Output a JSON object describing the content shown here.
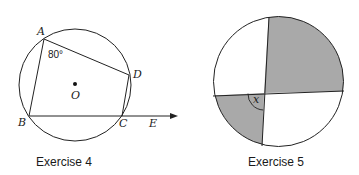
{
  "exercise4": {
    "caption": "Exercise 4",
    "labels": {
      "A": "A",
      "B": "B",
      "C": "C",
      "D": "D",
      "E": "E",
      "O": "O"
    },
    "angle_label": "80°",
    "circle": {
      "cx": 75,
      "cy": 85,
      "r": 56
    },
    "points": {
      "A": [
        44,
        39
      ],
      "B": [
        29,
        116
      ],
      "C": [
        122,
        116
      ],
      "D": [
        129,
        75
      ]
    },
    "ray_end": [
      176,
      116
    ]
  },
  "exercise5": {
    "caption": "Exercise 5",
    "angle_label": "x",
    "circle": {
      "cx": 278.5,
      "cy": 81.5,
      "r": 65
    },
    "shade_color": "#a9a9a9"
  }
}
